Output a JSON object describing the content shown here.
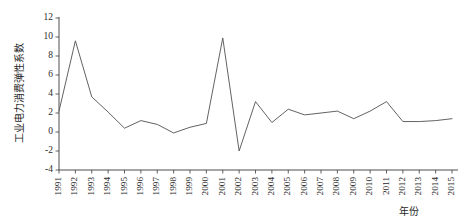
{
  "chart_data": {
    "type": "line",
    "title": "",
    "xlabel": "年份",
    "ylabel": "工业电力消费弹性系数",
    "categories": [
      "1991",
      "1992",
      "1993",
      "1994",
      "1995",
      "1996",
      "1997",
      "1998",
      "1999",
      "2000",
      "2001",
      "2002",
      "2003",
      "2004",
      "2005",
      "2006",
      "2007",
      "2008",
      "2009",
      "2010",
      "2011",
      "2012",
      "2013",
      "2014",
      "2015"
    ],
    "values": [
      2.2,
      9.6,
      3.7,
      2.1,
      0.4,
      1.2,
      0.8,
      -0.1,
      0.5,
      0.9,
      9.9,
      -2.0,
      3.2,
      1.0,
      2.4,
      1.8,
      2.0,
      2.2,
      1.4,
      2.2,
      3.2,
      1.1,
      1.1,
      1.2,
      1.4
    ],
    "series": [
      {
        "name": "工业电力消费弹性系数",
        "values": [
          2.2,
          9.6,
          3.7,
          2.1,
          0.4,
          1.2,
          0.8,
          -0.1,
          0.5,
          0.9,
          9.9,
          -2.0,
          3.2,
          1.0,
          2.4,
          1.8,
          2.0,
          2.2,
          1.4,
          2.2,
          3.2,
          1.1,
          1.1,
          1.2,
          1.4
        ]
      }
    ],
    "ylim": [
      -4,
      12
    ],
    "yticks": [
      -4,
      -2,
      0,
      2,
      4,
      6,
      8,
      10,
      12
    ],
    "ytick_labels": [
      "-4",
      "-2",
      "0",
      "2",
      "4",
      "6",
      "8",
      "10",
      "12"
    ],
    "xlim": [
      "1991",
      "2015"
    ],
    "grid": false,
    "legend": false,
    "legend_position": "none",
    "line_color": "#5a5a5a",
    "axis_color": "#3a3a3a",
    "background_color": "#ffffff"
  }
}
